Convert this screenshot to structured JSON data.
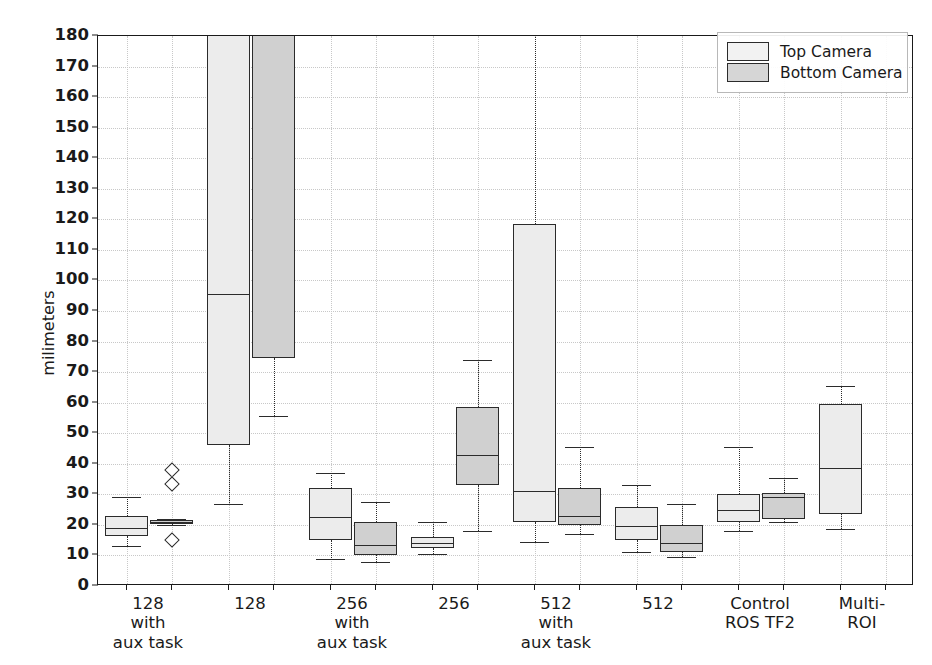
{
  "chart_data": {
    "type": "box",
    "title": "",
    "xlabel": "",
    "ylabel": "milimeters",
    "ylim": [
      0,
      180
    ],
    "yticks": [
      0,
      10,
      20,
      30,
      40,
      50,
      60,
      70,
      80,
      90,
      100,
      110,
      120,
      130,
      140,
      150,
      160,
      170,
      180
    ],
    "grid": true,
    "legend_position": "upper right",
    "categories": [
      "128\nwith\naux task",
      "128",
      "256\nwith\naux task",
      "256",
      "512\nwith\naux task",
      "512",
      "Control\nROS TF2",
      "Multi-ROI"
    ],
    "legend": [
      {
        "name": "Top Camera",
        "color": "#ececec"
      },
      {
        "name": "Bottom Camera",
        "color": "#d0d0d0"
      }
    ],
    "series": [
      {
        "name": "Top Camera",
        "boxes": [
          {
            "whisker_low": 13.0,
            "q1": 16.5,
            "median": 19.0,
            "q3": 23.0,
            "whisker_high": 29.0,
            "fliers": []
          },
          {
            "whisker_low": 27.0,
            "q1": 46.0,
            "median": 95.5,
            "q3": 205.0,
            "whisker_high": 205.0,
            "fliers": []
          },
          {
            "whisker_low": 9.0,
            "q1": 15.0,
            "median": 22.5,
            "q3": 32.0,
            "whisker_high": 37.0,
            "fliers": []
          },
          {
            "whisker_low": 10.5,
            "q1": 12.5,
            "median": 14.0,
            "q3": 16.0,
            "whisker_high": 21.0,
            "fliers": []
          },
          {
            "whisker_low": 14.5,
            "q1": 21.0,
            "median": 31.0,
            "q3": 118.5,
            "whisker_high": 195.0,
            "fliers": []
          },
          {
            "whisker_low": 11.0,
            "q1": 15.0,
            "median": 19.5,
            "q3": 26.0,
            "whisker_high": 33.0,
            "fliers": []
          },
          {
            "whisker_low": 18.0,
            "q1": 21.0,
            "median": 25.0,
            "q3": 30.0,
            "whisker_high": 45.5,
            "fliers": []
          },
          {
            "whisker_low": 18.5,
            "q1": 23.5,
            "median": 38.5,
            "q3": 59.5,
            "whisker_high": 65.5,
            "fliers": []
          }
        ]
      },
      {
        "name": "Bottom Camera",
        "boxes": [
          {
            "whisker_low": 20.0,
            "q1": 20.3,
            "median": 20.8,
            "q3": 21.5,
            "whisker_high": 21.8,
            "fliers": [
              38.0,
              33.5,
              15.0
            ]
          },
          {
            "whisker_low": 55.5,
            "q1": 74.5,
            "median": 195.0,
            "q3": 205.0,
            "whisker_high": 205.0,
            "fliers": []
          },
          {
            "whisker_low": 8.0,
            "q1": 10.0,
            "median": 13.5,
            "q3": 21.0,
            "whisker_high": 27.5,
            "fliers": []
          },
          {
            "whisker_low": 18.0,
            "q1": 33.0,
            "median": 43.0,
            "q3": 58.5,
            "whisker_high": 74.0,
            "fliers": []
          },
          {
            "whisker_low": 17.0,
            "q1": 20.0,
            "median": 23.0,
            "q3": 32.0,
            "whisker_high": 45.5,
            "fliers": []
          },
          {
            "whisker_low": 9.5,
            "q1": 11.0,
            "median": 14.0,
            "q3": 20.0,
            "whisker_high": 27.0,
            "fliers": []
          },
          {
            "whisker_low": 21.0,
            "q1": 22.0,
            "median": 29.0,
            "q3": 30.5,
            "whisker_high": 35.5,
            "fliers": []
          },
          {
            "whisker_low": null,
            "q1": null,
            "median": null,
            "q3": null,
            "whisker_high": null,
            "fliers": []
          }
        ]
      }
    ]
  }
}
